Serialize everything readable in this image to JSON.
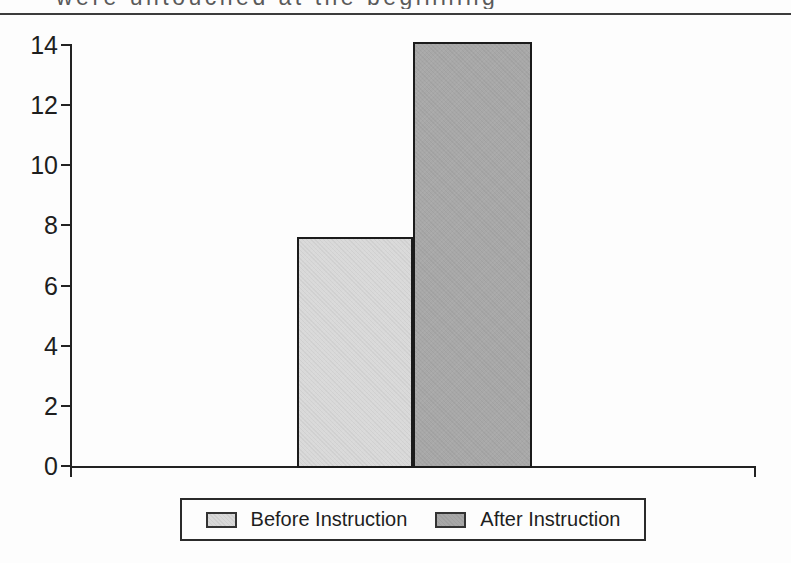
{
  "page": {
    "background": "#fdfdfd",
    "top_clipped_text_fragment": "were untouched at the beginning",
    "rule_color": "#3c3c3c"
  },
  "chart_data": {
    "type": "bar",
    "title": "",
    "xlabel": "",
    "ylabel": "",
    "categories": [
      "Before Instruction",
      "After Instruction"
    ],
    "values": [
      7.6,
      14.1
    ],
    "bar_colors": [
      "#d9d9d9",
      "#a8a8a8"
    ],
    "yticks": [
      0,
      2,
      4,
      6,
      8,
      10,
      12,
      14
    ],
    "ylim": [
      0,
      14.1
    ],
    "grid": false,
    "axis_color": "#222222",
    "legend_position": "bottom"
  },
  "legend": {
    "items": [
      {
        "label": "Before Instruction",
        "color": "#d9d9d9"
      },
      {
        "label": "After Instruction",
        "color": "#a8a8a8"
      }
    ]
  }
}
